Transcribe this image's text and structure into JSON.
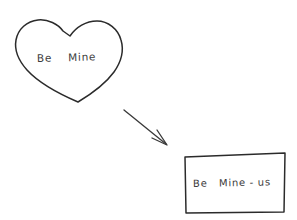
{
  "canvas": {
    "width": 297,
    "height": 220,
    "background_color": "#ffffff",
    "ink_color": "#2b2b2b"
  },
  "shapes": {
    "heart": {
      "name": "heart-shape",
      "label": "Be    Mine"
    },
    "arrow": {
      "name": "curved-arrow",
      "direction": "down-right",
      "label": ""
    },
    "rectangle": {
      "name": "rectangle-shape",
      "label": "Be   Mine - us"
    }
  }
}
